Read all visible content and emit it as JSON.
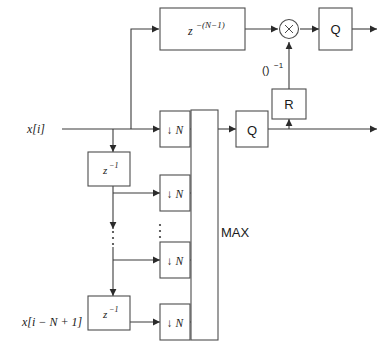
{
  "diagram": {
    "signals": {
      "input_top_label": "x[i]",
      "input_bottom_label": "x[i − N + 1]"
    },
    "blocks": {
      "delay_long": {
        "name": "z^-(N-1)",
        "base": "z",
        "exponent": "−(N−1)"
      },
      "delay_unit_1": {
        "name": "z^-1",
        "base": "z",
        "exponent": "−1"
      },
      "delay_unit_2": {
        "name": "z^-1",
        "base": "z",
        "exponent": "−1"
      },
      "downsampler_1": {
        "label": "↓ N",
        "arrow": "↓",
        "factor": "N"
      },
      "downsampler_2": {
        "label": "↓ N",
        "arrow": "↓",
        "factor": "N"
      },
      "downsampler_3": {
        "label": "↓ N",
        "arrow": "↓",
        "factor": "N"
      },
      "downsampler_4": {
        "label": "↓ N",
        "arrow": "↓",
        "factor": "N"
      },
      "max": {
        "label": "MAX"
      },
      "quantizer_top": {
        "label": "Q"
      },
      "quantizer_mid": {
        "label": "Q"
      },
      "reciprocal_unit": {
        "label": "R"
      },
      "multiplier": {
        "label": "×"
      }
    },
    "annotations": {
      "inverse_label": "()",
      "inverse_exponent": "−1",
      "ellipsis_bus": "⋮",
      "ellipsis_branch": "⋮"
    },
    "colors": {
      "line": "#3b3b3b",
      "block_stroke": "#4d4d4d",
      "background": "#ffffff",
      "text": "#1a1a1a"
    }
  }
}
